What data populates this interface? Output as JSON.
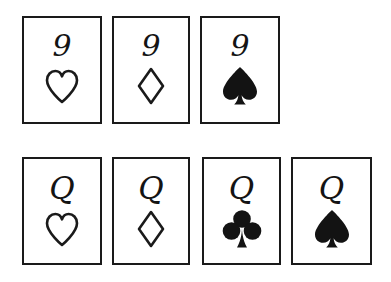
{
  "illustration": {
    "title": "Hand-drawn playing cards",
    "background_color": "#ffffff",
    "ink_color": "#1a1a1a",
    "rows": [
      {
        "name": "row-nines",
        "cards": [
          {
            "rank": "9",
            "suit": "hearts",
            "suit_symbol": "heart-outline-icon",
            "filled": false,
            "x": 22,
            "y": 16,
            "w": 80,
            "h": 108
          },
          {
            "rank": "9",
            "suit": "diamonds",
            "suit_symbol": "diamond-outline-icon",
            "filled": false,
            "x": 112,
            "y": 16,
            "w": 78,
            "h": 108
          },
          {
            "rank": "9",
            "suit": "spades",
            "suit_symbol": "spade-filled-icon",
            "filled": true,
            "x": 200,
            "y": 16,
            "w": 80,
            "h": 108
          }
        ]
      },
      {
        "name": "row-queens",
        "cards": [
          {
            "rank": "Q",
            "suit": "hearts",
            "suit_symbol": "heart-outline-icon",
            "filled": false,
            "x": 22,
            "y": 157,
            "w": 80,
            "h": 108
          },
          {
            "rank": "Q",
            "suit": "diamonds",
            "suit_symbol": "diamond-outline-icon",
            "filled": false,
            "x": 112,
            "y": 157,
            "w": 78,
            "h": 108
          },
          {
            "rank": "Q",
            "suit": "clubs",
            "suit_symbol": "club-filled-icon",
            "filled": true,
            "x": 202,
            "y": 157,
            "w": 79,
            "h": 108
          },
          {
            "rank": "Q",
            "suit": "spades",
            "suit_symbol": "spade-filled-icon",
            "filled": true,
            "x": 291,
            "y": 157,
            "w": 81,
            "h": 108
          }
        ]
      }
    ]
  }
}
